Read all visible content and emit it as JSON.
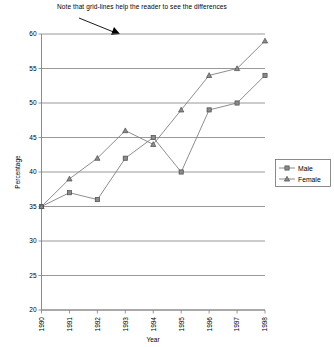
{
  "chart_data": {
    "type": "line",
    "title": "",
    "annotation": "Note that grid-lines help the reader to see the differences",
    "xlabel": "Year",
    "ylabel": "Percentage",
    "categories": [
      "1990",
      "1991",
      "1992",
      "1993",
      "1994",
      "1995",
      "1996",
      "1997",
      "1998"
    ],
    "ylim": [
      20,
      60
    ],
    "yticks": [
      "20",
      "25",
      "30",
      "35",
      "40",
      "45",
      "50",
      "55",
      "60"
    ],
    "grid": true,
    "legend_position": "right",
    "series": [
      {
        "name": "Male",
        "marker": "square",
        "values": [
          35,
          37,
          36,
          42,
          45,
          40,
          49,
          50,
          54
        ]
      },
      {
        "name": "Female",
        "marker": "triangle",
        "values": [
          35,
          39,
          42,
          46,
          44,
          49,
          54,
          55,
          59
        ]
      }
    ]
  },
  "colors": {
    "grid": "#7f7f7f",
    "line": "#808080",
    "marker_fill": "#8a8a8a",
    "marker_stroke": "#4a4a4a",
    "text": "#000000",
    "background": "#ffffff"
  }
}
